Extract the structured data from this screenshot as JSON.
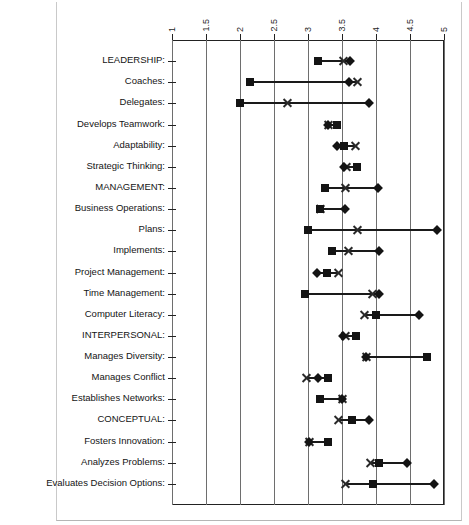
{
  "chart_data": {
    "type": "scatter",
    "title": "",
    "subtitle": "",
    "xlabel": "",
    "ylabel": "",
    "xlim": [
      1,
      5
    ],
    "xticks": [
      "1",
      "1.5",
      "2",
      "2.5",
      "3",
      "3.5",
      "4",
      "4.5",
      "5"
    ],
    "xtick_values": [
      1,
      1.5,
      2,
      2.5,
      3,
      3.5,
      4,
      4.5,
      5
    ],
    "grid": true,
    "legend": "none",
    "marker_names": [
      "square",
      "x",
      "diamond"
    ],
    "series": [
      {
        "name": "square",
        "marker": "square"
      },
      {
        "name": "x",
        "marker": "x"
      },
      {
        "name": "diamond",
        "marker": "diamond"
      }
    ],
    "categories": [
      "LEADERSHIP:",
      "Coaches:",
      "Delegates:",
      "Develops Teamwork:",
      "Adaptability:",
      "Strategic Thinking:",
      "MANAGEMENT:",
      "Business Operations:",
      "Plans:",
      "Implements:",
      "Project Management:",
      "Time Management:",
      "Computer Literacy:",
      "INTERPERSONAL:",
      "Manages Diversity:",
      "Manages Conflict",
      "Establishes Networks:",
      "CONCEPTUAL:",
      "Fosters Innovation:",
      "Analyzes Problems:",
      "Evaluates Decision Options:"
    ],
    "rows": [
      {
        "label": "LEADERSHIP:",
        "square": 3.15,
        "x": 3.52,
        "diamond": 3.62
      },
      {
        "label": "Coaches:",
        "square": 2.15,
        "x": 3.72,
        "diamond": 3.6
      },
      {
        "label": "Delegates:",
        "square": 2.0,
        "x": 2.7,
        "diamond": 3.9
      },
      {
        "label": "Develops Teamwork:",
        "square": 3.42,
        "x": 3.3,
        "diamond": 3.3
      },
      {
        "label": "Adaptability:",
        "square": 3.53,
        "x": 3.7,
        "diamond": 3.42
      },
      {
        "label": "Strategic Thinking:",
        "square": 3.72,
        "x": 3.57,
        "diamond": 3.53
      },
      {
        "label": "MANAGEMENT:",
        "square": 3.25,
        "x": 3.55,
        "diamond": 4.03
      },
      {
        "label": "Business Operations:",
        "square": 3.18,
        "x": 3.18,
        "diamond": 3.55
      },
      {
        "label": "Plans:",
        "square": 3.0,
        "x": 3.72,
        "diamond": 4.9
      },
      {
        "label": "Implements:",
        "square": 3.35,
        "x": 3.6,
        "diamond": 4.05
      },
      {
        "label": "Project Management:",
        "square": 3.28,
        "x": 3.45,
        "diamond": 3.13
      },
      {
        "label": "Time Management:",
        "square": 2.95,
        "x": 3.95,
        "diamond": 4.05
      },
      {
        "label": "Computer Literacy:",
        "square": 4.0,
        "x": 3.83,
        "diamond": 4.63
      },
      {
        "label": "INTERPERSONAL:",
        "square": 3.7,
        "x": 3.55,
        "diamond": 3.52
      },
      {
        "label": "Manages Diversity:",
        "square": 4.75,
        "x": 3.86,
        "diamond": 3.86
      },
      {
        "label": "Manages Conflict",
        "square": 3.3,
        "x": 2.98,
        "diamond": 3.15
      },
      {
        "label": "Establishes Networks:",
        "square": 3.18,
        "x": 3.5,
        "diamond": 3.5
      },
      {
        "label": "CONCEPTUAL:",
        "square": 3.65,
        "x": 3.45,
        "diamond": 3.9
      },
      {
        "label": "Fosters Innovation:",
        "square": 3.3,
        "x": 3.02,
        "diamond": 3.02
      },
      {
        "label": "Analyzes Problems:",
        "square": 4.05,
        "x": 3.92,
        "diamond": 4.45
      },
      {
        "label": "Evaluates Decision Options:",
        "square": 3.95,
        "x": 3.55,
        "diamond": 4.85
      }
    ]
  }
}
